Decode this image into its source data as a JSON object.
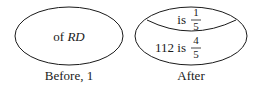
{
  "diagrams": [
    {
      "caption": "Before, 1",
      "text_prefix": "of ",
      "text_italic": "RD"
    },
    {
      "caption": "After",
      "top_region": {
        "prefix": "is",
        "numerator": "1",
        "denominator": "5"
      },
      "bottom_region": {
        "prefix": "112 is",
        "numerator": "4",
        "denominator": "5"
      }
    }
  ],
  "colors": {
    "stroke": "#1a1a1a",
    "background": "#ffffff"
  }
}
